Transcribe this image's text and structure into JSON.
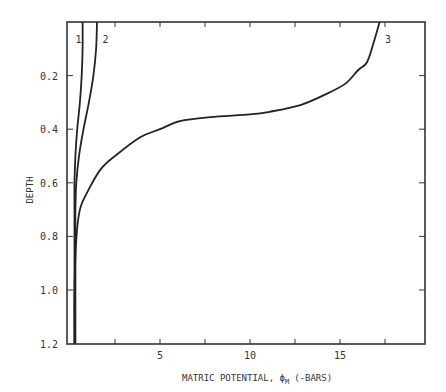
{
  "chart_data": {
    "type": "line",
    "title": "",
    "xlabel": "MATRIC POTENTIAL, ϕM (-BARS)",
    "xlabel_main": "MATRIC POTENTIAL, ϕ",
    "xlabel_sub": "M",
    "xlabel_units": "(-BARS)",
    "ylabel": "DEPTH",
    "xlim": [
      0,
      20
    ],
    "ylim": [
      1.2,
      0
    ],
    "y_inverted": true,
    "grid": false,
    "legend": "none (curves labeled inline 1, 2, 3)",
    "x_ticks": [
      2.5,
      5,
      7.5,
      10,
      12.5,
      15,
      17.5
    ],
    "x_tick_labels": [
      {
        "value": 5,
        "label": "5"
      },
      {
        "value": 10,
        "label": "10"
      },
      {
        "value": 15,
        "label": "15"
      }
    ],
    "y_tick_labels": [
      {
        "value": 0.2,
        "label": "0.2"
      },
      {
        "value": 0.4,
        "label": "0.4"
      },
      {
        "value": 0.6,
        "label": "0.6"
      },
      {
        "value": 0.8,
        "label": "0.8"
      },
      {
        "value": 1.0,
        "label": "1.0"
      },
      {
        "value": 1.2,
        "label": "1.2"
      }
    ],
    "series": [
      {
        "name": "1",
        "label_pos": {
          "x": 0.3,
          "depth": 0.08
        },
        "points": [
          {
            "x": 0.7,
            "depth": 0.0
          },
          {
            "x": 0.7,
            "depth": 0.1
          },
          {
            "x": 0.65,
            "depth": 0.2
          },
          {
            "x": 0.55,
            "depth": 0.3
          },
          {
            "x": 0.4,
            "depth": 0.4
          },
          {
            "x": 0.3,
            "depth": 0.5
          },
          {
            "x": 0.25,
            "depth": 0.6
          },
          {
            "x": 0.25,
            "depth": 0.7
          },
          {
            "x": 0.25,
            "depth": 0.8
          },
          {
            "x": 0.25,
            "depth": 1.0
          },
          {
            "x": 0.25,
            "depth": 1.2
          }
        ]
      },
      {
        "name": "2",
        "label_pos": {
          "x": 1.8,
          "depth": 0.08
        },
        "points": [
          {
            "x": 1.5,
            "depth": 0.0
          },
          {
            "x": 1.45,
            "depth": 0.1
          },
          {
            "x": 1.3,
            "depth": 0.2
          },
          {
            "x": 1.05,
            "depth": 0.3
          },
          {
            "x": 0.75,
            "depth": 0.4
          },
          {
            "x": 0.5,
            "depth": 0.5
          },
          {
            "x": 0.35,
            "depth": 0.6
          },
          {
            "x": 0.3,
            "depth": 0.7
          },
          {
            "x": 0.3,
            "depth": 0.8
          },
          {
            "x": 0.3,
            "depth": 1.0
          },
          {
            "x": 0.3,
            "depth": 1.2
          }
        ]
      },
      {
        "name": "3",
        "label_pos": {
          "x": 17.5,
          "depth": 0.08
        },
        "points": [
          {
            "x": 17.2,
            "depth": 0.0
          },
          {
            "x": 16.9,
            "depth": 0.07
          },
          {
            "x": 16.5,
            "depth": 0.15
          },
          {
            "x": 16.0,
            "depth": 0.18
          },
          {
            "x": 15.3,
            "depth": 0.23
          },
          {
            "x": 14.2,
            "depth": 0.27
          },
          {
            "x": 12.8,
            "depth": 0.31
          },
          {
            "x": 11.1,
            "depth": 0.335
          },
          {
            "x": 10.0,
            "depth": 0.345
          },
          {
            "x": 7.8,
            "depth": 0.355
          },
          {
            "x": 6.1,
            "depth": 0.37
          },
          {
            "x": 5.0,
            "depth": 0.4
          },
          {
            "x": 3.9,
            "depth": 0.43
          },
          {
            "x": 2.5,
            "depth": 0.5
          },
          {
            "x": 1.7,
            "depth": 0.55
          },
          {
            "x": 1.0,
            "depth": 0.63
          },
          {
            "x": 0.55,
            "depth": 0.7
          },
          {
            "x": 0.35,
            "depth": 0.81
          },
          {
            "x": 0.25,
            "depth": 1.0
          },
          {
            "x": 0.25,
            "depth": 1.2
          }
        ]
      }
    ]
  }
}
